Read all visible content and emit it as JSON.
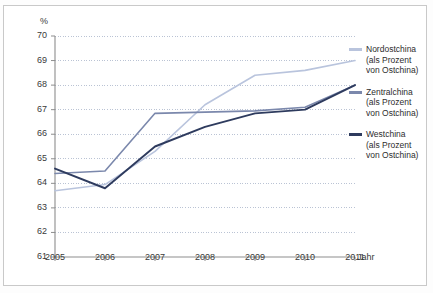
{
  "frame": {
    "border_color": "#c9c9c9",
    "background": "#ffffff"
  },
  "axis": {
    "y_unit_label": "%",
    "x_title": "Jahr"
  },
  "legend": {
    "entries": [
      {
        "name": "Nordostchina",
        "sub_line1": "(als Prozent",
        "sub_line2": "von Ostchina)",
        "color": "#b9c4dd"
      },
      {
        "name": "Zentralchina",
        "sub_line1": "(als Prozent",
        "sub_line2": "von Ostchina)",
        "color": "#7b88ac"
      },
      {
        "name": "Westchina",
        "sub_line1": "(als Prozent",
        "sub_line2": "von Ostchina)",
        "color": "#2e3b5e"
      }
    ]
  },
  "chart_data": {
    "type": "line",
    "title": "",
    "xlabel": "Jahr",
    "ylabel": "%",
    "categories": [
      "2005",
      "2006",
      "2007",
      "2008",
      "2009",
      "2010",
      "2011"
    ],
    "x": [
      2005,
      2006,
      2007,
      2008,
      2009,
      2010,
      2011
    ],
    "ylim": [
      61,
      70
    ],
    "yticks": [
      61,
      62,
      63,
      64,
      65,
      66,
      67,
      68,
      69,
      70
    ],
    "xlim": [
      2005,
      2011
    ],
    "grid": true,
    "legend_position": "right",
    "series": [
      {
        "name": "Nordostchina (als Prozent von Ostchina)",
        "color": "#b9c4dd",
        "values": [
          63.7,
          63.95,
          65.3,
          67.2,
          68.4,
          68.6,
          69.0
        ]
      },
      {
        "name": "Zentralchina (als Prozent von Ostchina)",
        "color": "#7b88ac",
        "values": [
          64.4,
          64.5,
          66.85,
          66.9,
          66.95,
          67.1,
          68.0
        ]
      },
      {
        "name": "Westchina (als Prozent von Ostchina)",
        "color": "#2e3b5e",
        "values": [
          64.6,
          63.8,
          65.5,
          66.3,
          66.85,
          67.0,
          68.0
        ]
      }
    ]
  }
}
